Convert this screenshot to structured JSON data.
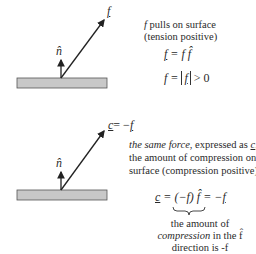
{
  "top_panel": {
    "force_label": "f",
    "normal_label": "n̂",
    "description_line1_var": "f",
    "description_line1_rest": " pulls on surface",
    "description_line2": "(tension positive)",
    "eq1_lhs": "f",
    "eq1_rhs": "= f f̂",
    "eq2_lhs": "f =",
    "eq2_abs": "f",
    "eq2_rhs": "> 0"
  },
  "bottom_panel": {
    "force_label_lhs": "c",
    "force_label_rhs": "= −",
    "force_label_var": "f",
    "normal_label": "n̂",
    "description_line1_italic": "the same force",
    "description_line1_rest": ", expressed as ",
    "description_line1_var": "c",
    "description_line1_end": ",",
    "description_line2": "the amount of compression on",
    "description_line3": "surface (compression positive)",
    "eq_lhs": "c",
    "eq_mid": "= (−f) f̂ = −",
    "eq_rhs_var": "f",
    "brace_note_line1": "the amount of",
    "brace_note_line2_italic": "compression",
    "brace_note_line2_rest": " in the f̂",
    "brace_note_line3": "direction is -f"
  },
  "colors": {
    "surface_fill": "#c8c8c8",
    "surface_stroke": "#555555",
    "arrow": "#222222"
  }
}
